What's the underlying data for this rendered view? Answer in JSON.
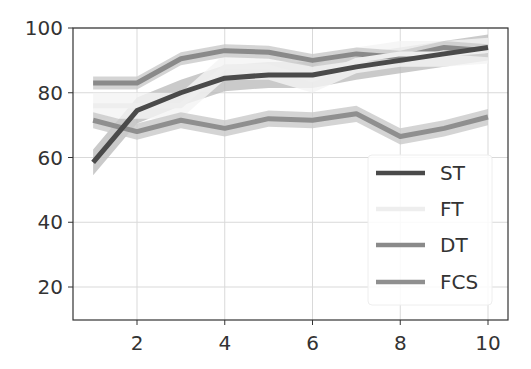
{
  "chart_data": {
    "type": "line",
    "title": "",
    "xlabel": "",
    "ylabel": "",
    "x": [
      1,
      2,
      3,
      4,
      5,
      6,
      7,
      8,
      9,
      10
    ],
    "xlim": [
      0.55,
      10.4
    ],
    "ylim": [
      10,
      100
    ],
    "xticks": [
      2,
      4,
      6,
      8,
      10
    ],
    "yticks": [
      20,
      40,
      60,
      80,
      100
    ],
    "xtick_labels": [
      "2",
      "4",
      "6",
      "8",
      "10"
    ],
    "ytick_labels": [
      "20",
      "40",
      "60",
      "80",
      "100"
    ],
    "grid": true,
    "legend_position": "lower right",
    "series": [
      {
        "name": "ST",
        "color": "#4a4a4a",
        "band": 4,
        "values": [
          58.5,
          74.5,
          80,
          84.5,
          85.5,
          85.5,
          88,
          90,
          92,
          94
        ]
      },
      {
        "name": "FT",
        "color": "#eeeeee",
        "band": 4,
        "values": [
          76,
          76,
          76,
          88,
          88,
          84,
          90,
          92,
          92,
          93
        ]
      },
      {
        "name": "DT",
        "color": "#8a8a8a",
        "band": 2,
        "values": [
          83,
          83,
          90.5,
          93,
          92.5,
          90,
          92,
          91,
          94,
          93
        ]
      },
      {
        "name": "FCS",
        "color": "#8f8f8f",
        "band": 2.5,
        "values": [
          71.5,
          68,
          71.5,
          69,
          72,
          71.5,
          73.5,
          66.5,
          69,
          72.5
        ]
      }
    ]
  },
  "legend": {
    "items": [
      {
        "label": "ST"
      },
      {
        "label": "FT"
      },
      {
        "label": "DT"
      },
      {
        "label": "FCS"
      }
    ]
  }
}
